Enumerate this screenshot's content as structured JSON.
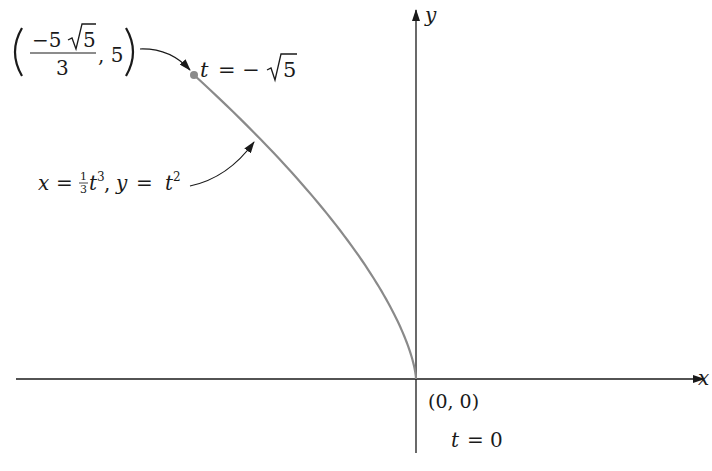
{
  "diagram": {
    "type": "parametric-curve",
    "axes": {
      "x_label": "x",
      "y_label": "y"
    },
    "curve": {
      "equation_label": "x = (1/3)t³, y = t²",
      "eq_x": "x",
      "eq_eq1": "=",
      "eq_frac_num": "1",
      "eq_frac_den": "3",
      "eq_t": "t",
      "eq_exp3": "3",
      "eq_comma": ",",
      "eq_y": "y",
      "eq_eq2": "=",
      "eq_t2": "t",
      "eq_exp2": "2",
      "color": "#8a8a8a"
    },
    "start_point": {
      "label": "(-5√5/3, 5)",
      "num": "−5√5",
      "num_minus5": "−5",
      "num_root": "5",
      "den": "3",
      "comma_y": ", 5",
      "t_label": "t = −√5",
      "t_var": "t",
      "t_eq": "= −",
      "t_root": "5",
      "color": "#8a8a8a"
    },
    "origin": {
      "label": "(0, 0)",
      "t_label": "t = 0",
      "t_var": "t",
      "t_rest": "= 0"
    }
  }
}
